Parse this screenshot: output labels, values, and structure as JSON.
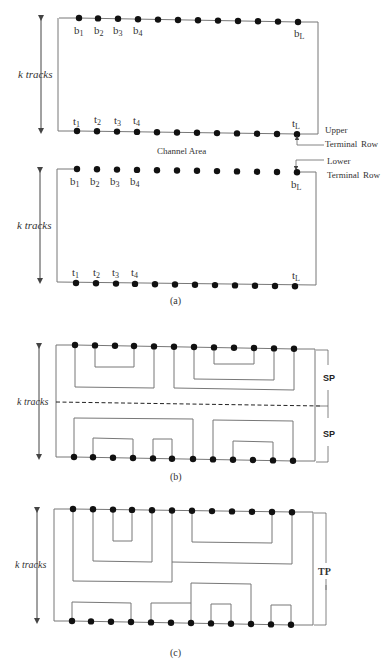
{
  "figure_a": {
    "caption": "(a)",
    "k_tracks_label": "k tracks",
    "channel_area_label": "Channel Area",
    "upper_label": "Upper",
    "lower_label": "Lower",
    "terminal_row_label": "Terminal",
    "row_label": "Row",
    "top_block": {
      "b_labels": [
        "b",
        "b",
        "b",
        "b",
        "b"
      ],
      "b_subs": [
        "1",
        "2",
        "3",
        "4",
        "L"
      ],
      "t_labels": [
        "t",
        "t",
        "t",
        "t",
        "t"
      ],
      "t_subs": [
        "1",
        "2",
        "3",
        "4",
        "L"
      ]
    },
    "bottom_block": {
      "b_labels": [
        "b",
        "b",
        "b",
        "b",
        "b"
      ],
      "b_subs": [
        "1",
        "2",
        "3",
        "4",
        "L"
      ],
      "t_labels": [
        "t",
        "t",
        "t",
        "t",
        "t"
      ],
      "t_subs": [
        "1",
        "2",
        "3",
        "4",
        "L"
      ]
    }
  },
  "figure_b": {
    "caption": "(b)",
    "k_tracks_label": "k tracks",
    "sp_top_label": "SP",
    "sp_bottom_label": "SP"
  },
  "figure_c": {
    "caption": "(c)",
    "k_tracks_label": "k tracks",
    "tp_label": "TP"
  }
}
